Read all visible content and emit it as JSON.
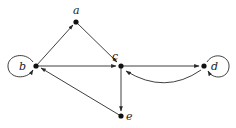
{
  "diagram": {
    "type": "directed-graph",
    "nodes": [
      {
        "id": "a",
        "label": "a",
        "x": 76,
        "y": 22
      },
      {
        "id": "b",
        "label": "b",
        "x": 36,
        "y": 66
      },
      {
        "id": "c",
        "label": "c",
        "x": 121,
        "y": 66
      },
      {
        "id": "d",
        "label": "d",
        "x": 204,
        "y": 66
      },
      {
        "id": "e",
        "label": "e",
        "x": 121,
        "y": 116
      }
    ],
    "edges": [
      {
        "from": "b",
        "to": "a"
      },
      {
        "from": "a",
        "to": "c"
      },
      {
        "from": "b",
        "to": "c"
      },
      {
        "from": "c",
        "to": "d"
      },
      {
        "from": "d",
        "to": "c",
        "curved": true
      },
      {
        "from": "c",
        "to": "e"
      },
      {
        "from": "e",
        "to": "b"
      },
      {
        "from": "b",
        "to": "b",
        "self_loop": true
      },
      {
        "from": "d",
        "to": "d",
        "self_loop": true
      }
    ]
  },
  "labels": {
    "a": "a",
    "b": "b",
    "c": "c",
    "d": "d",
    "e": "e"
  },
  "colors": {
    "edge": "#2a2a2a",
    "node": "#111111",
    "background": "#ffffff"
  }
}
